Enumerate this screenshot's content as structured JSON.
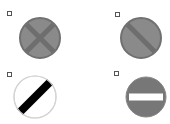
{
  "options": [
    {
      "id": "sign-1",
      "icon": "no-stopping-sign-icon",
      "checked": false,
      "colors": {
        "fill": "#8a8a8a",
        "border": "#6e6e6e",
        "cross": "#6e6e6e"
      }
    },
    {
      "id": "sign-2",
      "icon": "no-waiting-sign-icon",
      "checked": false,
      "colors": {
        "fill": "#8a8a8a",
        "border": "#6e6e6e",
        "bar": "#6e6e6e"
      }
    },
    {
      "id": "sign-3",
      "icon": "end-of-restrictions-sign-icon",
      "checked": false,
      "colors": {
        "fill": "#ffffff",
        "border": "#d0d0d0",
        "bar": "#000000"
      }
    },
    {
      "id": "sign-4",
      "icon": "no-entry-sign-icon",
      "checked": false,
      "colors": {
        "fill": "#777777",
        "bar": "#ffffff"
      }
    }
  ]
}
